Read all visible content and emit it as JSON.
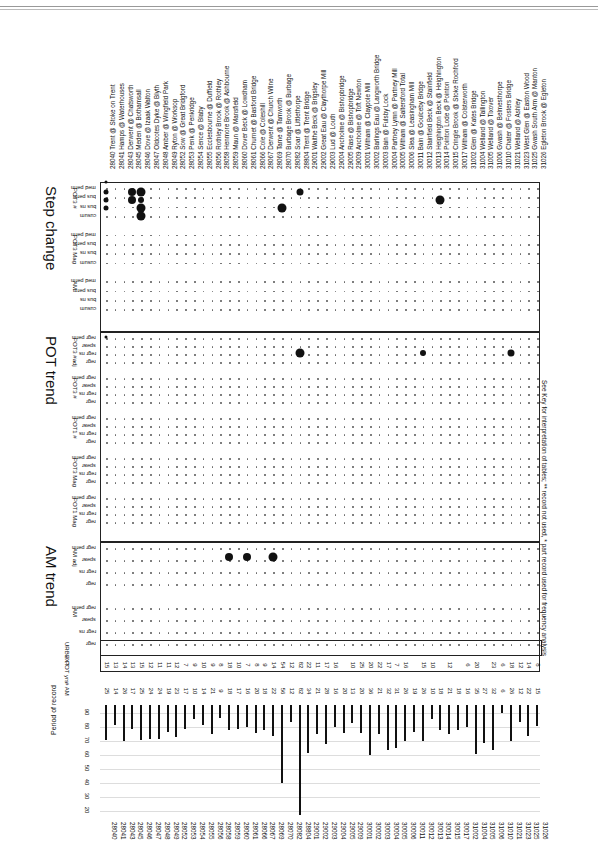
{
  "document": {
    "footnote": "See Key for interpretation of tables; ** record not used, * part record used for frequency analysis",
    "sections": [
      {
        "title": "Step change",
        "groups": [
          {
            "label": "POT3 #",
            "rows": [
              "med perm",
              "bus perm",
              "bus ns",
              "cusum"
            ]
          },
          {
            "label": "POT3 Mag",
            "rows": [
              "med perm",
              "bus perm",
              "bus ns",
              "cusum"
            ]
          },
          {
            "label": "AM",
            "rows": [
              "med perm",
              "bus perm",
              "bus ns",
              "cusum"
            ]
          }
        ]
      },
      {
        "title": "POT trend",
        "groups": [
          {
            "label": "POT3 #adj",
            "rows": [
              "regr perm",
              "spear",
              "regr ns",
              "regr"
            ]
          },
          {
            "label": "POT3 #",
            "rows": [
              "regr perm",
              "spear",
              "regr ns",
              "regr"
            ]
          },
          {
            "label": "POT1 #",
            "rows": [
              "regr perm",
              "spear",
              "regr ns",
              "regr"
            ]
          },
          {
            "label": "POT3 Mag",
            "rows": [
              "regr perm",
              "spear",
              "regr ns",
              "regr"
            ]
          },
          {
            "label": "POT1 Mag",
            "rows": [
              "regr perm",
              "spear",
              "regr ns",
              "regr"
            ]
          }
        ]
      },
      {
        "title": "AM trend",
        "groups": [
          {
            "label": "AM adj",
            "rows": [
              "regr perm",
              "spear",
              "regr ns",
              "regr"
            ]
          },
          {
            "label": "AM",
            "rows": [
              "regr perm",
              "spear",
              "regr ns",
              "regr"
            ]
          }
        ]
      }
    ],
    "extra_rows": [
      "URBEXT",
      "# POT yrs",
      "# AM"
    ],
    "chart_label": "Period of record",
    "chart_ticks": [
      "90",
      "80",
      "70",
      "60",
      "50",
      "40",
      "30",
      "20"
    ]
  },
  "stations": [
    {
      "id": "28040",
      "name": "Trent @ Stoke on Trent",
      "pot": "15",
      "am": "25"
    },
    {
      "id": "28041",
      "name": "Hamps @ Waterhouses",
      "pot": "13",
      "am": "14"
    },
    {
      "id": "28043",
      "name": "Derwent @ Chatsworth",
      "pot": "14",
      "am": "26"
    },
    {
      "id": "28045",
      "name": "Meden @ Bothamsall",
      "pot": "13",
      "am": "17"
    },
    {
      "id": "28046",
      "name": "Dove @ Izaak Walton",
      "pot": "15",
      "am": "25"
    },
    {
      "id": "28047",
      "name": "Oldcotes Dyke @ Blyth",
      "pot": "12",
      "am": "24"
    },
    {
      "id": "28048",
      "name": "Amber @ Wingfield Park",
      "pot": "11",
      "am": "24"
    },
    {
      "id": "28049",
      "name": "Ryton @ Worksop",
      "pot": "11",
      "am": "19"
    },
    {
      "id": "28052",
      "name": "Sow @ Great Bridgford",
      "pot": "12",
      "am": "23"
    },
    {
      "id": "28053",
      "name": "Penk @ Penkridge",
      "pot": "7",
      "am": "17"
    },
    {
      "id": "28054",
      "name": "Sence @ Blaby",
      "pot": "9",
      "am": "10"
    },
    {
      "id": "28055",
      "name": "Ecclesbourne @ Duffield",
      "pot": "10",
      "am": "14"
    },
    {
      "id": "28056",
      "name": "Rothley Brook @ Rothley",
      "pot": "9",
      "am": "21"
    },
    {
      "id": "28058",
      "name": "Henmore Brook @ Ashbourne",
      "pot": "8",
      "am": "9"
    },
    {
      "id": "28059",
      "name": "Maun @ Mansfield",
      "pot": "18",
      "am": "18"
    },
    {
      "id": "28060",
      "name": "Dover Beck @ Lowdham",
      "pot": "10",
      "am": "17"
    },
    {
      "id": "28061",
      "name": "Churnet @ Basford Bridge",
      "pot": "7",
      "am": "16"
    },
    {
      "id": "28066",
      "name": "Cole @ Coleshill",
      "pot": "8",
      "am": "20"
    },
    {
      "id": "28067",
      "name": "Derwent @ Church Wilne",
      "pot": "9",
      "am": "18"
    },
    {
      "id": "28069",
      "name": "Tame @ Tamworth",
      "pot": "14",
      "am": "22"
    },
    {
      "id": "28070",
      "name": "Burbage Brook @ Burbage",
      "pot": "54",
      "am": "56"
    },
    {
      "id": "28082",
      "name": "Soar @ Littlethorpe",
      "pot": "12",
      "am": "12"
    },
    {
      "id": "28804",
      "name": "Trent @ Trent Bridge",
      "pot": "82",
      "am": "82"
    },
    {
      "id": "29001",
      "name": "Waithe Beck @ Brigsley",
      "pot": "22",
      "am": "34"
    },
    {
      "id": "29002",
      "name": "Great Eau @ Claythorpe Mill",
      "pot": "11",
      "am": "21"
    },
    {
      "id": "29003",
      "name": "Lud @ Louth",
      "pot": "17",
      "am": "28"
    },
    {
      "id": "29004",
      "name": "Ancholme @ Bishopbridge",
      "pot": "16",
      "am": "16"
    },
    {
      "id": "29005",
      "name": "Rase @ Bishopbridge",
      "pot": "",
      "am": "20"
    },
    {
      "id": "29009",
      "name": "Ancholme @ Toft Newton",
      "pot": "10",
      "am": "13"
    },
    {
      "id": "30001",
      "name": "Witham @ Claypole Mill",
      "pot": "25",
      "am": "20"
    },
    {
      "id": "30002",
      "name": "Barlings Eau @ Langworth Bridge",
      "pot": "20",
      "am": "36"
    },
    {
      "id": "30003",
      "name": "Bain @ Fulsby Lock",
      "pot": "22",
      "am": "21"
    },
    {
      "id": "30004",
      "name": "Partney Lymn @ Partney Mill",
      "pot": "17",
      "am": "32"
    },
    {
      "id": "30005",
      "name": "Witham @ Saltersford Total",
      "pot": "7",
      "am": "31"
    },
    {
      "id": "30006",
      "name": "Slea @ Leasingham Mill",
      "pot": "16",
      "am": "26"
    },
    {
      "id": "30011",
      "name": "Bain @ Goulceby Bridge",
      "pot": "",
      "am": "19"
    },
    {
      "id": "30012",
      "name": "Stainfield Beck @ Stainfield",
      "pot": "15",
      "am": "26"
    },
    {
      "id": "30013",
      "name": "Heighington Beck @ Heighington",
      "pot": "10",
      "am": "10"
    },
    {
      "id": "30014",
      "name": "Pointon Lode @ Pointon",
      "pot": "",
      "am": "18"
    },
    {
      "id": "30015",
      "name": "Cringle Brook @ Stoke Rochford",
      "pot": "12",
      "am": "21"
    },
    {
      "id": "30017",
      "name": "Witham @ Colsterworth",
      "pot": "",
      "am": "18"
    },
    {
      "id": "31002",
      "name": "Glen @ Kates Bridge",
      "pot": "6",
      "am": "16"
    },
    {
      "id": "31004",
      "name": "Welland @ Tallington",
      "pot": "20",
      "am": "35"
    },
    {
      "id": "31005",
      "name": "Welland @ Tixover",
      "pot": "",
      "am": "27"
    },
    {
      "id": "31006",
      "name": "Gwash @ Belmesthorpe",
      "pot": "23",
      "am": "32"
    },
    {
      "id": "31010",
      "name": "Chater @ Fosters Bridge",
      "pot": "6",
      "am": "6"
    },
    {
      "id": "31021",
      "name": "Welland @ Ashley",
      "pot": "18",
      "am": "26"
    },
    {
      "id": "31023",
      "name": "West Glen @ Easton Wood",
      "pot": "12",
      "am": "12"
    },
    {
      "id": "31025",
      "name": "Gwash South Arm @ Manton",
      "pot": "14",
      "am": "22"
    },
    {
      "id": "31026",
      "name": "Egleton Brook @ Egleton",
      "pot": "8",
      "am": "15"
    }
  ]
}
